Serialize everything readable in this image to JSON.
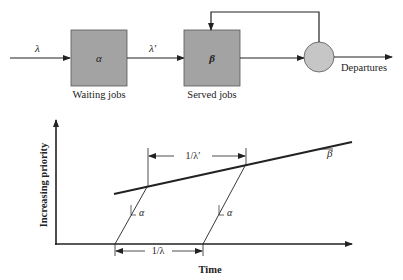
{
  "colors": {
    "box_fill": "#a3a3a3",
    "circle_fill": "#c6c6c6",
    "line": "#222222",
    "background": "#ffffff"
  },
  "queue_diagram": {
    "input_rate_label": "λ",
    "waiting_box": {
      "symbol": "α",
      "label": "Waiting jobs"
    },
    "transfer_rate_label": "λ′",
    "served_box": {
      "symbol": "β",
      "label": "Served jobs"
    },
    "server": {
      "shape": "circle"
    },
    "output_label": "Departures",
    "feedback": "server output loops back to served jobs queue"
  },
  "priority_chart": {
    "y_axis_label": "Increasing priority",
    "x_axis_label": "Time",
    "served_slope_label": "β",
    "waiting_slope_label_1": "α",
    "waiting_slope_label_2": "α",
    "interarrival_label": "1/λ",
    "interacceptance_label": "1/λ′"
  }
}
